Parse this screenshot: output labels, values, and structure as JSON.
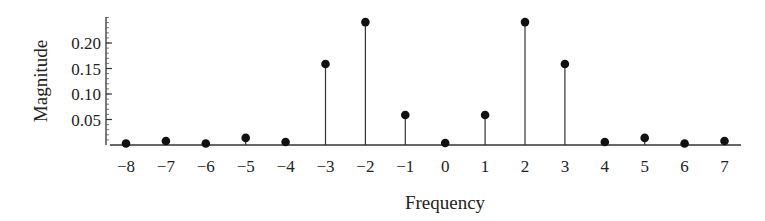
{
  "chart_data": {
    "type": "stem",
    "title": "",
    "xlabel": "Frequency",
    "ylabel": "Magnitude",
    "x": [
      -8,
      -7,
      -6,
      -5,
      -4,
      -3,
      -2,
      -1,
      0,
      1,
      2,
      3,
      4,
      5,
      6,
      7
    ],
    "values": [
      0.001,
      0.006,
      0.001,
      0.012,
      0.004,
      0.157,
      0.239,
      0.057,
      0.002,
      0.057,
      0.239,
      0.157,
      0.004,
      0.012,
      0.001,
      0.006
    ],
    "xticks": [
      "−8",
      "−7",
      "−6",
      "−5",
      "−4",
      "−3",
      "−2",
      "−1",
      "0",
      "1",
      "2",
      "3",
      "4",
      "5",
      "6",
      "7"
    ],
    "yticks": [
      {
        "value": 0.05,
        "label": "0.05"
      },
      {
        "value": 0.1,
        "label": "0.10"
      },
      {
        "value": 0.15,
        "label": "0.15"
      },
      {
        "value": 0.2,
        "label": "0.20"
      }
    ],
    "ylim": [
      0,
      0.25
    ],
    "xlim": [
      -8.5,
      7.4
    ],
    "minor_tick_step": 0.01,
    "grid": false,
    "legend": null,
    "marker_color": "#111111",
    "stem_color": "#333333"
  }
}
